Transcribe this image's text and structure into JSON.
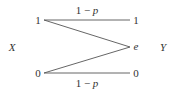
{
  "diagram": {
    "type": "binary-erasure-channel",
    "input_label": "X",
    "output_label": "Y",
    "inputs": [
      {
        "id": "x1",
        "label": "1"
      },
      {
        "id": "x0",
        "label": "0"
      }
    ],
    "outputs": [
      {
        "id": "y1",
        "label": "1"
      },
      {
        "id": "ye",
        "label": "e"
      },
      {
        "id": "y0",
        "label": "0"
      }
    ],
    "edges": [
      {
        "from": "x1",
        "to": "y1",
        "label": "1 − p"
      },
      {
        "from": "x1",
        "to": "ye",
        "label": ""
      },
      {
        "from": "x0",
        "to": "ye",
        "label": ""
      },
      {
        "from": "x0",
        "to": "y0",
        "label": "1 − p"
      }
    ],
    "colors": {
      "line": "#555555",
      "text": "#333333",
      "background": "#ffffff"
    }
  }
}
